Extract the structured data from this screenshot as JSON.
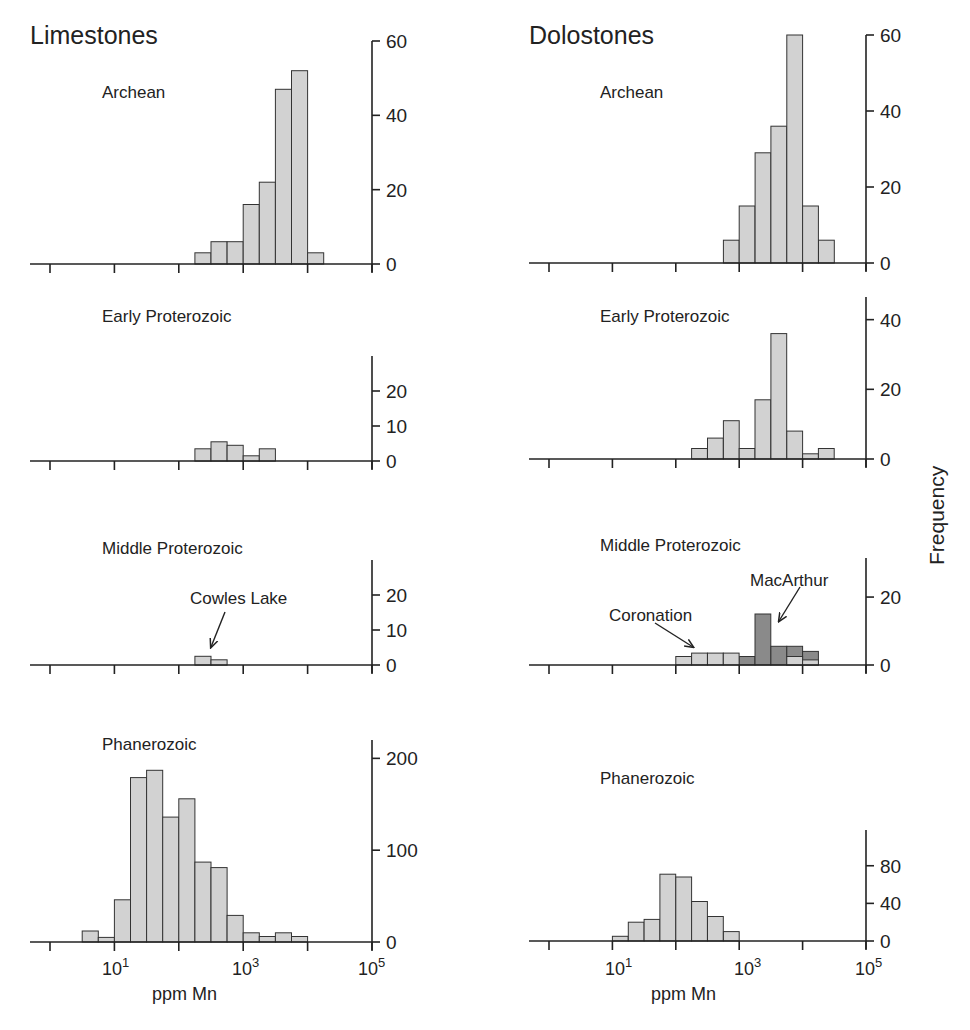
{
  "columns": [
    {
      "title": "Limestones",
      "xlabel": "ppm Mn"
    },
    {
      "title": "Dolostones",
      "xlabel": "ppm Mn"
    }
  ],
  "ylabel": "Frequency",
  "x_tick_labels": [
    {
      "base": "10",
      "exp": "1"
    },
    {
      "base": "10",
      "exp": "3"
    },
    {
      "base": "10",
      "exp": "5"
    }
  ],
  "colors": {
    "bar_light": "#d2d2d2",
    "bar_dark": "#8a8a8a",
    "stroke": "#333333"
  },
  "chart_data": [
    {
      "type": "bar",
      "title": "Limestones — Archean",
      "xscale": "log10",
      "bin_width_decades": 0.25,
      "first_bin_log10": 2.25,
      "values": [
        3,
        6,
        6,
        16,
        22,
        47,
        52,
        3
      ],
      "ylabel": "Frequency",
      "xlabel": "ppm Mn",
      "yticks": [
        0,
        20,
        40,
        60
      ],
      "ylim": [
        0,
        60
      ]
    },
    {
      "type": "bar",
      "title": "Dolostones — Archean",
      "xscale": "log10",
      "bin_width_decades": 0.25,
      "first_bin_log10": 2.75,
      "values": [
        6,
        15,
        29,
        36,
        60,
        15,
        6
      ],
      "ylabel": "Frequency",
      "xlabel": "ppm Mn",
      "yticks": [
        0,
        20,
        40,
        60
      ],
      "ylim": [
        0,
        60
      ]
    },
    {
      "type": "bar",
      "title": "Limestones — Early Proterozoic",
      "xscale": "log10",
      "bin_width_decades": 0.25,
      "first_bin_log10": 2.25,
      "values": [
        3.5,
        5.5,
        4.5,
        1.5,
        3.5
      ],
      "yticks": [
        0,
        10,
        20
      ],
      "ylim": [
        0,
        30
      ]
    },
    {
      "type": "bar",
      "title": "Dolostones — Early Proterozoic",
      "xscale": "log10",
      "bin_width_decades": 0.25,
      "first_bin_log10": 2.25,
      "values": [
        3,
        6,
        11,
        3,
        17,
        36,
        8,
        1.5,
        3
      ],
      "yticks": [
        0,
        20,
        40
      ],
      "ylim": [
        0,
        45
      ]
    },
    {
      "type": "bar",
      "title": "Limestones — Middle Proterozoic",
      "xscale": "log10",
      "bin_width_decades": 0.25,
      "first_bin_log10": 2.25,
      "values": [
        2.5,
        1.5
      ],
      "annotations": [
        {
          "text": "Cowles Lake",
          "bin": 0
        }
      ],
      "yticks": [
        0,
        10,
        20
      ],
      "ylim": [
        0,
        30
      ]
    },
    {
      "type": "bar",
      "title": "Dolostones — Middle Proterozoic",
      "xscale": "log10",
      "bin_width_decades": 0.25,
      "first_bin_log10": 2.0,
      "series": [
        {
          "name": "Coronation",
          "values": [
            2.5,
            3.5,
            3.5,
            3.5,
            0,
            0,
            0,
            2.5,
            1.5
          ]
        },
        {
          "name": "MacArthur",
          "values": [
            0,
            0,
            0,
            0,
            2.5,
            15,
            5.5,
            3,
            2.5
          ]
        }
      ],
      "annotations": [
        {
          "text": "Coronation",
          "bin": 1
        },
        {
          "text": "MacArthur",
          "bin": 5
        }
      ],
      "yticks": [
        0,
        20
      ],
      "ylim": [
        0,
        30
      ]
    },
    {
      "type": "bar",
      "title": "Limestones — Phanerozoic",
      "xscale": "log10",
      "bin_width_decades": 0.25,
      "first_bin_log10": 0.5,
      "values": [
        12,
        5,
        46,
        179,
        187,
        136,
        156,
        87,
        81,
        29,
        10,
        6,
        10,
        6
      ],
      "xticks": [
        "10^1",
        "10^3",
        "10^5"
      ],
      "yticks": [
        0,
        100,
        200
      ],
      "ylim": [
        0,
        220
      ]
    },
    {
      "type": "bar",
      "title": "Dolostones — Phanerozoic",
      "xscale": "log10",
      "bin_width_decades": 0.25,
      "first_bin_log10": 1.0,
      "values": [
        5,
        20,
        23,
        71,
        68,
        42,
        26,
        10
      ],
      "xticks": [
        "10^1",
        "10^3",
        "10^5"
      ],
      "yticks": [
        0,
        40,
        80
      ],
      "ylim": [
        0,
        120
      ]
    }
  ],
  "panels": [
    {
      "id": "ls-arch",
      "label": "Archean",
      "col": 0,
      "x0": 50,
      "axisX": 372,
      "y0": 264,
      "ytop": 41,
      "ymax": 60,
      "yticks": [
        0,
        20,
        40,
        60
      ],
      "labelX": 102,
      "labelY": 98,
      "binStart": 2.25,
      "values": [
        3,
        6,
        6,
        16,
        22,
        47,
        52,
        3
      ]
    },
    {
      "id": "do-arch",
      "label": "Archean",
      "col": 1,
      "x0": 549,
      "axisX": 866,
      "y0": 263,
      "ytop": 35,
      "ymax": 60,
      "yticks": [
        0,
        20,
        40,
        60
      ],
      "labelX": 600,
      "labelY": 98,
      "binStart": 2.75,
      "values": [
        6,
        15,
        29,
        36,
        60,
        15,
        6
      ]
    },
    {
      "id": "ls-ep",
      "label": "Early Proterozoic",
      "col": 0,
      "x0": 50,
      "axisX": 372,
      "y0": 461,
      "ytop": 356,
      "ymax": 30,
      "yticks": [
        0,
        10,
        20
      ],
      "labelX": 102,
      "labelY": 322,
      "binStart": 2.25,
      "values": [
        3.5,
        5.5,
        4.5,
        1.5,
        3.5
      ]
    },
    {
      "id": "do-ep",
      "label": "Early Proterozoic",
      "col": 1,
      "x0": 549,
      "axisX": 866,
      "y0": 459,
      "ytop": 297,
      "ymax": 46.5,
      "yticks": [
        0,
        20,
        40
      ],
      "labelX": 600,
      "labelY": 322,
      "binStart": 2.25,
      "values": [
        3,
        6,
        11,
        3,
        17,
        36,
        8,
        1.5,
        3
      ]
    },
    {
      "id": "ls-mp",
      "label": "Middle Proterozoic",
      "col": 0,
      "x0": 50,
      "axisX": 372,
      "y0": 665,
      "ytop": 560,
      "ymax": 30,
      "yticks": [
        0,
        10,
        20
      ],
      "labelX": 102,
      "labelY": 554,
      "binStart": 2.25,
      "values": [
        2.5,
        1.5
      ]
    },
    {
      "id": "do-mp",
      "label": "Middle Proterozoic",
      "col": 1,
      "x0": 549,
      "axisX": 866,
      "y0": 665,
      "ytop": 558,
      "ymax": 31.5,
      "yticks": [
        0,
        20
      ],
      "labelX": 600,
      "labelY": 551,
      "binStart": 2.0,
      "light": [
        2.5,
        3.5,
        3.5,
        3.5,
        0,
        0,
        0,
        2.5,
        1.5
      ],
      "dark": [
        0,
        0,
        0,
        0,
        2.5,
        15,
        5.5,
        5.5,
        4
      ]
    },
    {
      "id": "ls-ph",
      "label": "Phanerozoic",
      "col": 0,
      "x0": 50,
      "axisX": 372,
      "y0": 942,
      "ytop": 740,
      "ymax": 220,
      "yticks": [
        0,
        100,
        200
      ],
      "labelX": 102,
      "labelY": 750,
      "binStart": 0.5,
      "values": [
        12,
        5,
        46,
        179,
        187,
        136,
        156,
        87,
        81,
        29,
        10,
        6,
        10,
        6
      ]
    },
    {
      "id": "do-ph",
      "label": "Phanerozoic",
      "col": 1,
      "x0": 549,
      "axisX": 866,
      "y0": 941,
      "ytop": 830,
      "ymax": 118,
      "yticks": [
        0,
        40,
        80
      ],
      "labelX": 600,
      "labelY": 784,
      "binStart": 1.0,
      "values": [
        5,
        20,
        23,
        71,
        68,
        42,
        26,
        10
      ]
    }
  ],
  "annotations": [
    {
      "text": "Cowles Lake",
      "x": 190,
      "y": 604,
      "ax1": 225,
      "ay1": 612,
      "ax2": 211,
      "ay2": 647
    },
    {
      "text": "Coronation",
      "x": 609,
      "y": 621,
      "ax1": 655,
      "ay1": 623,
      "ax2": 693,
      "ay2": 647
    },
    {
      "text": "MacArthur",
      "x": 750,
      "y": 586,
      "ax1": 800,
      "ay1": 587,
      "ax2": 779,
      "ay2": 621
    }
  ]
}
